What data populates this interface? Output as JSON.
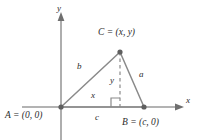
{
  "figure": {
    "axes": {
      "x_label": "x",
      "y_label": "y"
    },
    "vertices": [
      {
        "id": "A",
        "label": "A = (0, 0)",
        "point_name": "vertex-a",
        "x": 61,
        "y": 107
      },
      {
        "id": "B",
        "label": "B = (c, 0)",
        "point_name": "vertex-b",
        "x": 144,
        "y": 107
      },
      {
        "id": "C",
        "label": "C = (x, y)",
        "point_name": "vertex-c",
        "x": 120,
        "y": 52
      }
    ],
    "segment_labels": {
      "side_b": "b",
      "side_a": "a",
      "height_y": "y",
      "base_x": "x",
      "base_c": "c"
    },
    "markers": {
      "right_angle": "right-angle-marker",
      "dashed_altitude": "dashed-altitude-line"
    },
    "colors": {
      "line": "#8a8a8a",
      "axis": "#9a9a9a",
      "text": "#2b2b2b",
      "background": "#ffffff"
    }
  }
}
